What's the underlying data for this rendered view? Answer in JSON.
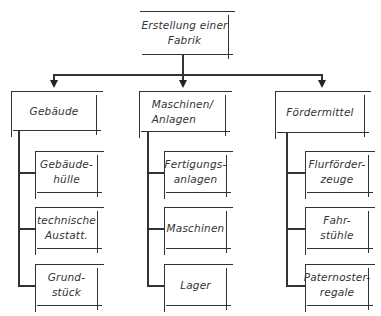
{
  "root": {
    "label": "Erstellung einer\nFabrik"
  },
  "categories": [
    {
      "label": "Gebäude",
      "children": [
        {
          "label": "Gebäude-\nhülle"
        },
        {
          "label": "technische\nAustatt."
        },
        {
          "label": "Grund-\nstück"
        }
      ]
    },
    {
      "label": "Maschinen/\nAnlagen",
      "children": [
        {
          "label": "Fertigungs-\nanlagen"
        },
        {
          "label": "Maschinen"
        },
        {
          "label": "Lager"
        }
      ]
    },
    {
      "label": "Fördermittel",
      "children": [
        {
          "label": "Flurförder-\nzeuge"
        },
        {
          "label": "Fahr-\nstühle"
        },
        {
          "label": "Paternoster-\nregale"
        }
      ]
    }
  ],
  "colors": {
    "line": "#333333",
    "background": "#ffffff"
  }
}
